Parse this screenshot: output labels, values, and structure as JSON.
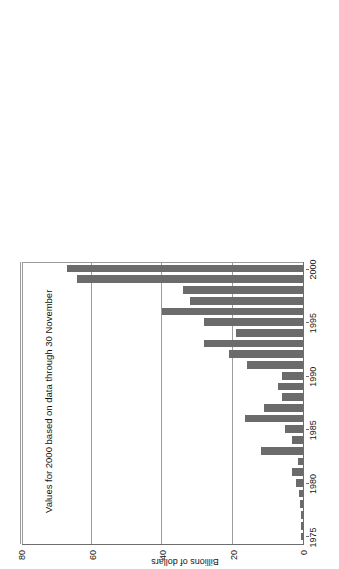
{
  "figure": {
    "annotation": "Values for 2000 based on data through 30 November",
    "value_axis_title": "Billions of dollars",
    "orientation": "page rotated 90 degrees counter-clockwise",
    "bar_color": "#6b6b6b",
    "gridline_color": "#9c9c9c",
    "axis_color": "#6e6e6e"
  },
  "chart_data": {
    "type": "bar",
    "title": "",
    "subtitle": "",
    "annotations": [
      "Values for 2000 based on data through 30 November"
    ],
    "xlabel": "",
    "ylabel": "Billions of dollars",
    "xlim": [
      1974.3,
      2000.7
    ],
    "ylim": [
      0,
      80
    ],
    "y_ticks": [
      0,
      20,
      40,
      60,
      80
    ],
    "y_tick_labels": [
      "0",
      "20",
      "40",
      "60",
      "80"
    ],
    "x_ticks": [
      1975,
      1980,
      1985,
      1990,
      1995,
      2000
    ],
    "x_tick_labels": [
      "1975",
      "1980",
      "1985",
      "1990",
      "1995",
      "2000"
    ],
    "grid": "horizontal",
    "legend": null,
    "legend_position": "none",
    "categories": [
      "1975",
      "1976",
      "1977",
      "1978",
      "1979",
      "1980",
      "1981",
      "1982",
      "1983",
      "1984",
      "1985",
      "1986",
      "1987",
      "1988",
      "1989",
      "1990",
      "1991",
      "1992",
      "1993",
      "1994",
      "1995",
      "1996",
      "1997",
      "1998",
      "1999",
      "2000"
    ],
    "values": [
      0.5,
      0.7,
      0.5,
      0.8,
      1.0,
      2.0,
      3.0,
      1.5,
      12.0,
      3.0,
      5.0,
      16.5,
      11.0,
      6.0,
      7.0,
      6.0,
      16.0,
      21.0,
      28.0,
      19.0,
      28.0,
      40.0,
      32.0,
      34.0,
      64.0,
      67.0
    ]
  }
}
